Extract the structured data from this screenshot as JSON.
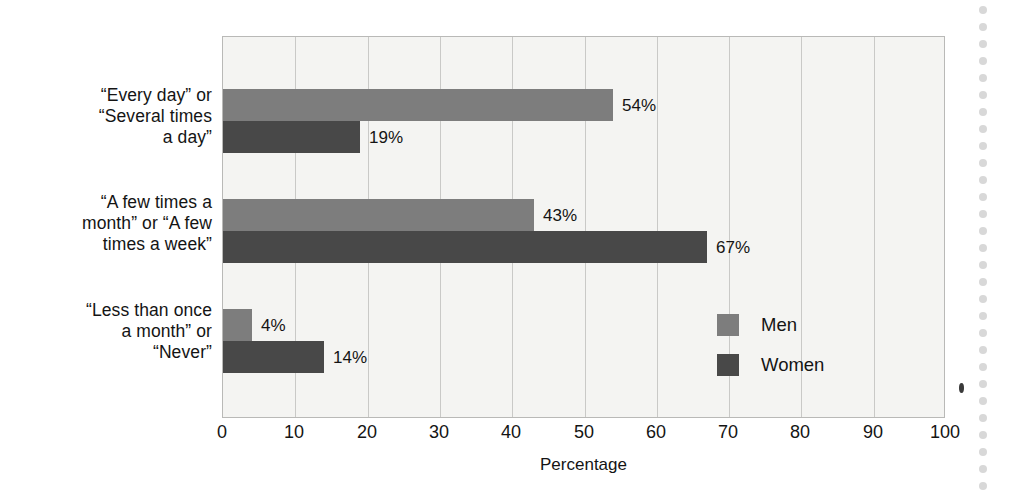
{
  "chart_data": {
    "type": "bar",
    "orientation": "horizontal",
    "title": "",
    "xlabel": "Percentage",
    "ylabel": "",
    "xlim": [
      0,
      100
    ],
    "xticks": [
      0,
      10,
      20,
      30,
      40,
      50,
      60,
      70,
      80,
      90,
      100
    ],
    "xtick_labels": [
      "0",
      "10",
      "20",
      "30",
      "40",
      "50",
      "60",
      "70",
      "80",
      "90",
      "100"
    ],
    "grid": true,
    "grid_axis": "x",
    "legend_position": "center-right-inside",
    "categories": [
      "“Every day” or\n“Several times\na day”",
      "“A few times a\nmonth” or “A few\ntimes a week”",
      "“Less than once\na month” or\n“Never”"
    ],
    "series": [
      {
        "name": "Men",
        "color": "#7d7d7d",
        "values": [
          54,
          43,
          4
        ],
        "value_labels": [
          "54%",
          "43%",
          "4%"
        ]
      },
      {
        "name": "Women",
        "color": "#484848",
        "values": [
          19,
          67,
          14
        ],
        "value_labels": [
          "19%",
          "67%",
          "14%"
        ]
      }
    ]
  },
  "legend": {
    "items": [
      {
        "label": "Men",
        "color": "#7d7d7d"
      },
      {
        "label": "Women",
        "color": "#484848"
      }
    ]
  },
  "axis": {
    "x_title": "Percentage"
  },
  "colors": {
    "men": "#7d7d7d",
    "women": "#484848",
    "plot_background": "#f4f4f2",
    "gridline": "#c9c9c7",
    "plot_border": "#b9b9b7",
    "text": "#141414"
  }
}
